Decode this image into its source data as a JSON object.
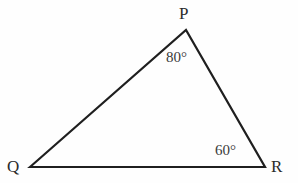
{
  "figure": {
    "kind": "triangle-diagram",
    "background_color": "#fefefe",
    "stroke_color": "#1f1f1f",
    "text_color": "#2b2b2b",
    "stroke_width": 2.2,
    "vertices": [
      {
        "name": "P",
        "label": "P",
        "x": 186,
        "y": 30
      },
      {
        "name": "Q",
        "label": "Q",
        "x": 30,
        "y": 167
      },
      {
        "name": "R",
        "label": "R",
        "x": 265,
        "y": 167
      }
    ],
    "edges": [
      {
        "name": "edge-QP",
        "from": "Q",
        "to": "P"
      },
      {
        "name": "edge-PR",
        "from": "P",
        "to": "R"
      },
      {
        "name": "edge-QR",
        "from": "Q",
        "to": "R"
      }
    ],
    "angles": [
      {
        "at": "P",
        "label": "80°",
        "value": 80
      },
      {
        "at": "R",
        "label": "60°",
        "value": 60
      }
    ],
    "labels": {
      "vertex_p": "P",
      "vertex_q": "Q",
      "vertex_r": "R",
      "angle_p": "80°",
      "angle_r": "60°"
    },
    "path_d": "M 30 167 L 186 30 L 265 167 Z"
  }
}
